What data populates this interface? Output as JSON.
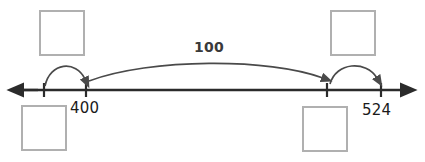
{
  "worksheet": {
    "type": "open-number-line",
    "width": 425,
    "height": 162,
    "background_color": "#ffffff"
  },
  "number_line": {
    "axis_color": "#2b2b2b",
    "left_arrow_label": "left-arrowhead",
    "right_arrow_label": "right-arrowhead",
    "ticks": [
      {
        "name": "tick-unlabeled-left",
        "x": 44,
        "label": ""
      },
      {
        "name": "tick-400",
        "x": 86,
        "label": "400"
      },
      {
        "name": "tick-unlabeled-right",
        "x": 327,
        "label": ""
      },
      {
        "name": "tick-524",
        "x": 381,
        "label": "524"
      }
    ],
    "labels": {
      "start_value": "400",
      "end_value": "524"
    }
  },
  "jumps": [
    {
      "name": "jump-arc-left",
      "label": "",
      "from_x": 45,
      "to_x": 86,
      "direction": "right"
    },
    {
      "name": "jump-arc-center",
      "label": "100",
      "from_x": 88,
      "to_x": 327,
      "direction": "right"
    },
    {
      "name": "jump-arc-right",
      "label": "",
      "from_x": 329,
      "to_x": 381,
      "direction": "right"
    }
  ],
  "answer_boxes": [
    {
      "name": "answer-box-top-left",
      "value": "",
      "position": "above-left"
    },
    {
      "name": "answer-box-top-right",
      "value": "",
      "position": "above-right"
    },
    {
      "name": "answer-box-bottom-left",
      "value": "",
      "position": "below-left"
    },
    {
      "name": "answer-box-bottom-right",
      "value": "",
      "position": "below-right"
    }
  ],
  "colors": {
    "axis": "#2b2b2b",
    "arc": "#4a4a4a",
    "box_border": "#b0b0b0",
    "text": "#1a1a1a",
    "jump_label": "#3a3a3a"
  }
}
